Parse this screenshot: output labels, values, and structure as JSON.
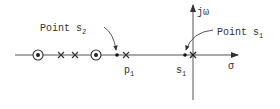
{
  "diagram": {
    "type": "s-plane pole-zero plot",
    "axes": {
      "real_label": "σ",
      "imag_label": "jω"
    },
    "annotations": {
      "point_s2": {
        "text": "Point s",
        "sub": "2"
      },
      "point_s1": {
        "text": "Point s",
        "sub": "1"
      },
      "p1": {
        "text": "p",
        "sub": "1"
      },
      "s1": {
        "text": "s",
        "sub": "1"
      }
    },
    "elements": {
      "zeros": 2,
      "poles": 4,
      "points": [
        "s1",
        "s2"
      ]
    },
    "colors": {
      "ink": "#333333",
      "background": "#ffffff"
    }
  }
}
